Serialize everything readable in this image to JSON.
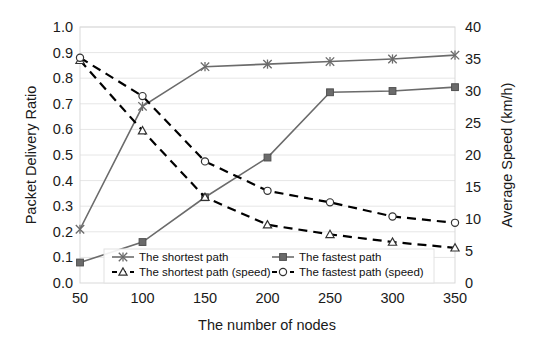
{
  "chart_data": {
    "type": "line",
    "title": "",
    "xlabel": "The number of nodes",
    "ylabel": "Packet Delivery Ratio",
    "y2label": "Average Speed (km/h)",
    "categories": [
      50,
      100,
      150,
      200,
      250,
      300,
      350
    ],
    "x": [
      50,
      100,
      150,
      200,
      250,
      300,
      350
    ],
    "xlim": [
      50,
      350
    ],
    "ylim": [
      0.0,
      1.0
    ],
    "y2lim": [
      0,
      40
    ],
    "xticks": [
      "50",
      "100",
      "150",
      "200",
      "250",
      "300",
      "350"
    ],
    "yticks": [
      "0.0",
      "0.1",
      "0.2",
      "0.3",
      "0.4",
      "0.5",
      "0.6",
      "0.7",
      "0.8",
      "0.9",
      "1.0"
    ],
    "y2ticks": [
      "0",
      "5",
      "10",
      "15",
      "20",
      "25",
      "30",
      "35",
      "40"
    ],
    "grid": true,
    "legend_position": "lower-center-inside",
    "series": [
      {
        "name": "The shortest path",
        "axis": "left",
        "marker": "cross",
        "line": "solid",
        "color": "#6b6b6b",
        "values": [
          0.21,
          0.69,
          0.845,
          0.855,
          0.865,
          0.875,
          0.89
        ]
      },
      {
        "name": "The fastest path",
        "axis": "left",
        "marker": "square",
        "line": "solid",
        "color": "#6b6b6b",
        "values": [
          0.08,
          0.16,
          0.335,
          0.49,
          0.745,
          0.75,
          0.765
        ]
      },
      {
        "name": "The shortest path (speed)",
        "axis": "right",
        "marker": "triangle",
        "line": "dashed",
        "color": "#000000",
        "values": [
          34.8,
          23.8,
          13.4,
          9.1,
          7.6,
          6.4,
          5.5
        ]
      },
      {
        "name": "The fastest path (speed)",
        "axis": "right",
        "marker": "circle",
        "line": "dashed",
        "color": "#000000",
        "values": [
          35.2,
          29.2,
          19.0,
          14.4,
          12.6,
          10.4,
          9.4
        ]
      }
    ]
  },
  "legend": {
    "items": [
      {
        "label": "The shortest path",
        "marker": "cross",
        "line": "solid"
      },
      {
        "label": "The fastest path",
        "marker": "square",
        "line": "solid"
      },
      {
        "label": "The shortest path (speed)",
        "marker": "triangle",
        "line": "dashed"
      },
      {
        "label": "The fastest path (speed)",
        "marker": "circle",
        "line": "dashed"
      }
    ]
  },
  "colors": {
    "solid_series": "#6b6b6b",
    "dashed_series": "#000000",
    "grid": "#e6e6e6",
    "frame": "#d9d9d9",
    "background": "#ffffff"
  }
}
